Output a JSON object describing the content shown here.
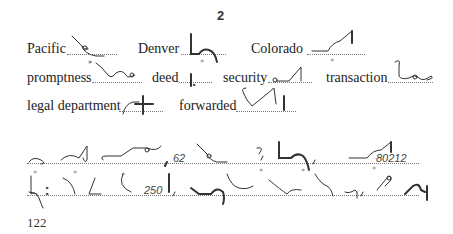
{
  "header": {
    "page_section": "2"
  },
  "vocabulary": [
    {
      "word": "Pacific",
      "outline_icon": "shorthand-outline-pacific"
    },
    {
      "word": "Denver",
      "outline_icon": "shorthand-outline-denver"
    },
    {
      "word": "Colorado",
      "outline_icon": "shorthand-outline-colorado"
    },
    {
      "word": "promptness",
      "outline_icon": "shorthand-outline-promptness"
    },
    {
      "word": "deed",
      "outline_icon": "shorthand-outline-deed"
    },
    {
      "word": "security",
      "outline_icon": "shorthand-outline-security"
    },
    {
      "word": "transaction",
      "outline_icon": "shorthand-outline-transaction"
    },
    {
      "word": "legal department",
      "outline_icon": "shorthand-outline-legal-department"
    },
    {
      "word": "forwarded",
      "outline_icon": "shorthand-outline-forwarded"
    }
  ],
  "passage": {
    "line1_numbers": [
      "62",
      "80212"
    ],
    "line2_numbers": [
      "250"
    ]
  },
  "footer": {
    "page_number": "122"
  }
}
